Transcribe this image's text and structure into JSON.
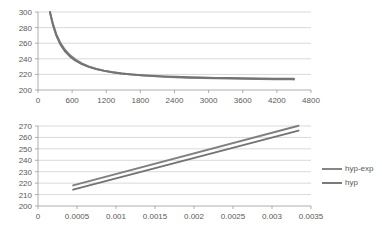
{
  "figure": {
    "background": "#ffffff",
    "grid_color": "#c9c9c9",
    "axis_color": "#9a9a9a",
    "text_color": "#595959"
  },
  "chart_data": [
    {
      "id": "top",
      "type": "line",
      "title": "",
      "xlabel": "",
      "ylabel": "",
      "xlim": [
        0,
        4800
      ],
      "ylim": [
        200,
        300
      ],
      "xticks": [
        0,
        600,
        1200,
        1800,
        2400,
        3000,
        3600,
        4200,
        4800
      ],
      "xtick_labels": [
        "0",
        "600",
        "1200",
        "1800",
        "2400",
        "3000",
        "3600",
        "4200",
        "4800"
      ],
      "yticks": [
        200,
        220,
        240,
        260,
        280,
        300
      ],
      "ytick_labels": [
        "200",
        "220",
        "240",
        "260",
        "280",
        "300"
      ],
      "grid": true,
      "legend": "none",
      "series": [
        {
          "name": "hyp-exp",
          "color": "#808080",
          "x": [
            210,
            260,
            320,
            390,
            470,
            560,
            660,
            770,
            890,
            1020,
            1160,
            1310,
            1470,
            1640,
            1820,
            2010,
            2210,
            2420,
            2640,
            2870,
            3110,
            3360,
            3620,
            3890,
            4170,
            4460,
            4500
          ],
          "y": [
            300.0,
            285.5,
            272.0,
            261.0,
            252.0,
            244.8,
            239.0,
            234.2,
            230.4,
            227.3,
            224.8,
            222.8,
            221.2,
            219.8,
            218.7,
            217.8,
            217.0,
            216.3,
            215.8,
            215.3,
            214.9,
            214.6,
            214.3,
            214.0,
            213.8,
            213.6,
            213.55
          ]
        },
        {
          "name": "hyp",
          "color": "#737373",
          "x": [
            210,
            260,
            320,
            390,
            470,
            560,
            660,
            770,
            890,
            1020,
            1160,
            1310,
            1470,
            1640,
            1820,
            2010,
            2210,
            2420,
            2640,
            2870,
            3110,
            3360,
            3620,
            3890,
            4170,
            4460,
            4500
          ],
          "y": [
            300.0,
            284.0,
            270.0,
            258.8,
            250.0,
            243.0,
            237.5,
            233.1,
            229.6,
            226.8,
            224.5,
            222.7,
            221.2,
            220.0,
            219.0,
            218.2,
            217.5,
            216.9,
            216.4,
            216.0,
            215.6,
            215.3,
            215.0,
            214.8,
            214.6,
            214.4,
            214.35
          ]
        }
      ]
    },
    {
      "id": "bottom",
      "type": "line",
      "title": "",
      "xlabel": "",
      "ylabel": "",
      "xlim": [
        0,
        0.0035
      ],
      "ylim": [
        200,
        270
      ],
      "xticks": [
        0,
        0.0005,
        0.001,
        0.0015,
        0.002,
        0.0025,
        0.003,
        0.0035
      ],
      "xtick_labels": [
        "0",
        "0.0005",
        "0.001",
        "0.0015",
        "0.002",
        "0.0025",
        "0.003",
        "0.0035"
      ],
      "yticks": [
        200,
        210,
        220,
        230,
        240,
        250,
        260,
        270
      ],
      "ytick_labels": [
        "200",
        "210",
        "220",
        "230",
        "240",
        "250",
        "260",
        "270"
      ],
      "grid": true,
      "legend": "right",
      "series": [
        {
          "name": "hyp-exp",
          "color": "#808080",
          "x": [
            0.00045,
            0.00334
          ],
          "y": [
            218.0,
            270.2
          ]
        },
        {
          "name": "hyp",
          "color": "#737373",
          "x": [
            0.00045,
            0.00334
          ],
          "y": [
            214.3,
            266.0
          ]
        }
      ]
    }
  ],
  "legend": {
    "position": "right",
    "entries": [
      {
        "label": "hyp-exp",
        "color": "#808080"
      },
      {
        "label": "hyp",
        "color": "#737373"
      }
    ]
  }
}
